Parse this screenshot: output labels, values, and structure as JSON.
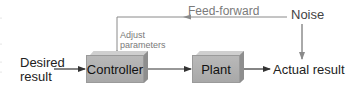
{
  "diagram": {
    "type": "control-system-block-diagram",
    "blocks": [
      {
        "id": "controller",
        "label": "Controller"
      },
      {
        "id": "plant",
        "label": "Plant"
      }
    ],
    "labels": {
      "desired_line1": "Desired",
      "desired_line2": "result",
      "actual": "Actual result",
      "noise": "Noise",
      "feedforward": "Feed-forward",
      "adjust_line1": "Adjust",
      "adjust_line2": "parameters"
    },
    "edges": [
      {
        "from": "Desired result",
        "to": "Controller"
      },
      {
        "from": "Controller",
        "to": "Plant"
      },
      {
        "from": "Plant",
        "to": "Actual result"
      },
      {
        "from": "Noise",
        "to": "Actual result"
      },
      {
        "from": "Noise",
        "to": "Controller",
        "label": "Feed-forward",
        "style": "gray"
      }
    ],
    "colors": {
      "block_fill": "#b0b0b0",
      "block_top": "#cfcfcf",
      "block_side": "#8e8e8e",
      "main_arrow": "#333333",
      "feedforward_arrow": "#8a8a8a",
      "text": "#222222",
      "muted_text": "#7a7a7a"
    }
  }
}
